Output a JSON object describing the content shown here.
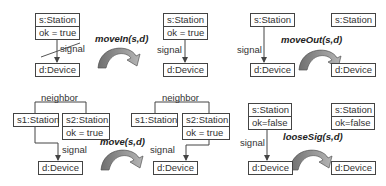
{
  "rules": [
    {
      "name": "moveIn",
      "operation": "moveIn(s,d)",
      "lhs": {
        "station": {
          "name": "s:Station",
          "attr": "ok = true"
        },
        "device": {
          "name": "d:Device"
        },
        "edge": {
          "label": "signal",
          "negated": true
        }
      },
      "rhs": {
        "station": {
          "name": "s:Station",
          "attr": "ok = true"
        },
        "device": {
          "name": "d:Device"
        },
        "edge": {
          "label": "signal",
          "negated": false
        }
      }
    },
    {
      "name": "moveOut",
      "operation": "moveOut(s,d)",
      "lhs": {
        "station": {
          "name": "s:Station"
        },
        "device": {
          "name": "d:Device"
        },
        "edge": {
          "label": "signal"
        }
      },
      "rhs": {
        "station": {
          "name": "s:Station"
        },
        "device": {
          "name": "d:Device"
        }
      }
    },
    {
      "name": "move",
      "operation": "move(s,d)",
      "lhs": {
        "neighbor_label": "neighbor",
        "station1": {
          "name": "s1:Station"
        },
        "station2": {
          "name": "s2:Station",
          "attr": "ok = true"
        },
        "device": {
          "name": "d:Device"
        },
        "edge": {
          "label": "signal",
          "from": "s1"
        }
      },
      "rhs": {
        "neighbor_label": "neighbor",
        "station1": {
          "name": "s1:Station"
        },
        "station2": {
          "name": "s2:Station",
          "attr": "ok = true"
        },
        "device": {
          "name": "d:Device"
        },
        "edge": {
          "label": "signal",
          "from": "s2"
        }
      }
    },
    {
      "name": "looseSig",
      "operation": "looseSig(s,d)",
      "lhs": {
        "station": {
          "name": "s:Station",
          "attr": "ok=false"
        },
        "device": {
          "name": "d:Device"
        },
        "edge": {
          "label": "signal"
        }
      },
      "rhs": {
        "station": {
          "name": "s:Station",
          "attr": "ok=false"
        },
        "device": {
          "name": "d:Device"
        }
      }
    }
  ],
  "colors": {
    "arrow_fill": "#8a8a8a",
    "arrow_stroke": "#555555",
    "line": "#444444"
  }
}
